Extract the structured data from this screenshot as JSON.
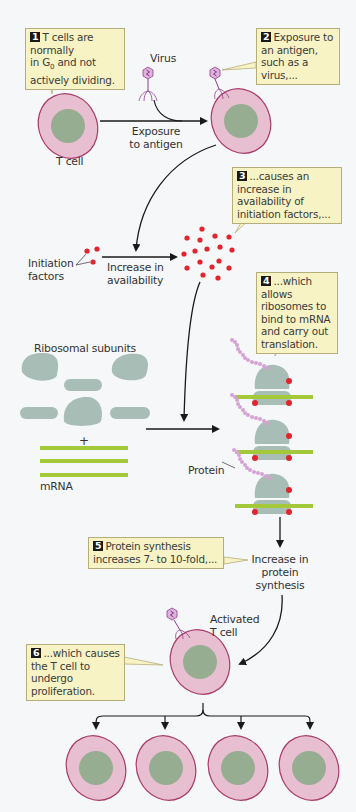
{
  "callouts": [
    {
      "num": "1",
      "text_a": "T cells are normally",
      "text_b": "in G",
      "sub": "0",
      "text_c": " and not",
      "text_d": "actively dividing."
    },
    {
      "num": "2",
      "text": "Exposure to an antigen, such as a virus,..."
    },
    {
      "num": "3",
      "text": "...causes an increase in availability of initiation factors,..."
    },
    {
      "num": "4",
      "text": "...which allows ribosomes to bind to mRNA and carry out translation."
    },
    {
      "num": "5",
      "text": "Protein synthesis increases 7- to 10-fold,..."
    },
    {
      "num": "6",
      "text": "...which causes the T cell to undergo proliferation."
    }
  ],
  "labels": {
    "virus": "Virus",
    "t_cell": "T cell",
    "exposure": "Exposure",
    "to_antigen": "to antigen",
    "initiation": "Initiation",
    "factors": "factors",
    "increase_in": "Increase in",
    "availability": "availability",
    "ribosomal_subunits": "Ribosomal subunits",
    "plus": "+",
    "mrna": "mRNA",
    "protein": "Protein",
    "increase_protein_1": "Increase in",
    "increase_protein_2": "protein",
    "increase_protein_3": "synthesis",
    "activated_1": "Activated",
    "activated_2": "T cell"
  },
  "colors": {
    "background": "#f6f7f9",
    "cell_fill": "#e8bfd0",
    "cell_stroke": "#a83c6a",
    "nucleus": "#96ad92",
    "ribosome": "#a9bdb7",
    "mrna": "#a3c93a",
    "initiation_factor": "#e0252f",
    "protein_chain": "#d5a3d6",
    "callout_fill": "#f7f3c4",
    "callout_border": "#b5ae7b"
  }
}
